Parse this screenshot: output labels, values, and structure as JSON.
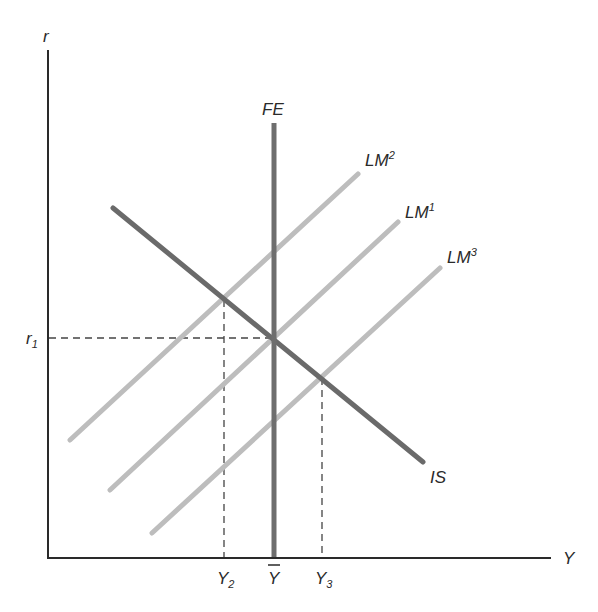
{
  "diagram": {
    "type": "IS-LM-FE",
    "axes": {
      "y_label": "r",
      "x_label": "Y"
    },
    "curves": {
      "FE": {
        "label": "FE",
        "color": "#6e6e6e"
      },
      "IS": {
        "label": "IS",
        "color": "#6e6e6e"
      },
      "LM1": {
        "label_base": "LM",
        "label_sup": "1",
        "color": "#b9b9b9"
      },
      "LM2": {
        "label_base": "LM",
        "label_sup": "2",
        "color": "#b9b9b9"
      },
      "LM3": {
        "label_base": "LM",
        "label_sup": "3",
        "color": "#b9b9b9"
      }
    },
    "tick_labels": {
      "r1_base": "r",
      "r1_sub": "1",
      "y2_base": "Y",
      "y2_sub": "2",
      "ybar": "Y",
      "y3_base": "Y",
      "y3_sub": "3"
    }
  }
}
